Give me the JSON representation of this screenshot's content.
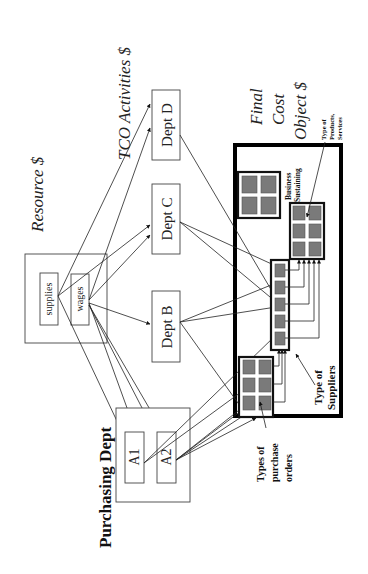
{
  "figure": {
    "orientation": "rotated-90-ccw",
    "headers": {
      "resource": "Resource $",
      "activities": "TCO Activities $",
      "final_line1": "Final",
      "final_line2": "Cost",
      "final_line3": "Object $"
    },
    "resource_box": {
      "items": [
        {
          "label": "supplies"
        },
        {
          "label": "wages"
        }
      ]
    },
    "departments": [
      {
        "label": "Dept D"
      },
      {
        "label": "Dept C"
      },
      {
        "label": "Dept B"
      }
    ],
    "purchasing": {
      "title": "Purchasing Dept",
      "activities": [
        {
          "label": "A1"
        },
        {
          "label": "A2"
        }
      ]
    },
    "cost_objects": {
      "business_sustaining_line1": "Business",
      "business_sustaining_line2": "Sustaining",
      "products_line1": "Type of",
      "products_line2": "Products,",
      "products_line3": "Services",
      "suppliers_line1": "Type of",
      "suppliers_line2": "Suppliers",
      "orders_line1": "Types of",
      "orders_line2": "purchase",
      "orders_line3": "orders"
    },
    "colors": {
      "cell_fill": "#7a7a7a",
      "line": "#222222",
      "background": "#ffffff"
    }
  }
}
